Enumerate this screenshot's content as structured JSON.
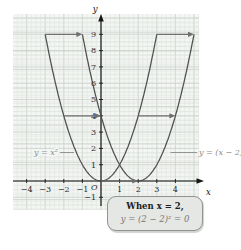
{
  "figure": {
    "kind": "math-graph",
    "background": "#ffffff"
  },
  "chart_data": {
    "type": "line",
    "title": "",
    "x_axis": {
      "label": "x",
      "range": [
        -4.8,
        5.3
      ],
      "tick_labels": [
        -4,
        -3,
        -2,
        -1,
        1,
        2,
        3,
        4
      ]
    },
    "y_axis": {
      "label": "y",
      "range": [
        -1.8,
        10.2
      ],
      "tick_labels": [
        -1,
        1,
        2,
        3,
        4,
        5,
        6,
        7,
        8,
        9
      ]
    },
    "origin_label": "O",
    "grid": true,
    "series": [
      {
        "name": "y = x²",
        "vertex": [
          0,
          0
        ],
        "domain": [
          -3,
          3
        ],
        "points_sample": [
          [
            -3,
            9
          ],
          [
            -2,
            4
          ],
          [
            -1,
            1
          ],
          [
            0,
            0
          ],
          [
            1,
            1
          ],
          [
            2,
            4
          ],
          [
            3,
            9
          ]
        ]
      },
      {
        "name": "y = (x − 2)²",
        "vertex": [
          2,
          0
        ],
        "domain": [
          -1,
          5
        ],
        "points_sample": [
          [
            -1,
            9
          ],
          [
            0,
            4
          ],
          [
            1,
            1
          ],
          [
            2,
            0
          ],
          [
            3,
            1
          ],
          [
            4,
            4
          ],
          [
            5,
            9
          ]
        ]
      }
    ],
    "translation_arrows": [
      {
        "from": [
          -3,
          9
        ],
        "to": [
          -1,
          9
        ]
      },
      {
        "from": [
          3,
          9
        ],
        "to": [
          5,
          9
        ]
      },
      {
        "from": [
          -2,
          4
        ],
        "to": [
          0,
          4
        ]
      },
      {
        "from": [
          2,
          4
        ],
        "to": [
          4,
          4
        ]
      },
      {
        "from": [
          0,
          0
        ],
        "to": [
          2,
          0
        ]
      }
    ]
  },
  "callout": {
    "line1": "When x = 2,",
    "line2": "y = (2 − 2)² = 0"
  },
  "colors": {
    "paper": "#f4f6f3",
    "grid_minor": "#dde2dd",
    "grid_major": "#cbd1cb",
    "axis": "#151515",
    "curve": "#4f4f4f",
    "arrow": "#6f6f6f",
    "tick_text": "#2b2b2b",
    "curve_label": "#8a8a8a",
    "callout_bg": "#e5e7e4",
    "callout_border": "#8f948f",
    "callout_text1": "#1c1c1c",
    "callout_text2": "#767676"
  }
}
